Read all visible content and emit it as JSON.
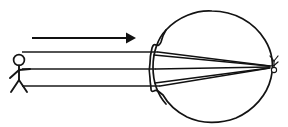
{
  "diagram": {
    "caption": "Light rays from a standing person travel to the right, refract at the cornea and lens of the eye, and converge to form a small inverted image on the retina.",
    "background_color": "#ffffff",
    "ink_color": "#141414",
    "canvas": {
      "width": 288,
      "height": 127
    }
  },
  "object": {
    "name": "stick-figure-person",
    "label": "",
    "role": "object being viewed",
    "position": {
      "x": 22,
      "y": 68
    },
    "head_radius": 5.4
  },
  "light_direction": {
    "name": "light-travel-arrow",
    "label": "",
    "description": "arrow showing direction light travels",
    "from_x": 32,
    "to_x": 135,
    "y": 38
  },
  "rays": {
    "count": 3,
    "description": "three parallel incident rays",
    "incident_y_values": [
      52,
      69,
      86
    ],
    "start_x": 22,
    "cornea_x": 152,
    "focal_point": {
      "x": 271,
      "y": 67
    }
  },
  "eye": {
    "name": "eyeball",
    "label": "",
    "center": {
      "x": 212,
      "y": 66
    },
    "radius_x": 62,
    "radius_y": 56,
    "cornea_side": "left",
    "retina_side": "right"
  },
  "retinal_image": {
    "name": "inverted-image",
    "label": "",
    "description": "tiny inverted stick figure formed on the retina",
    "position": {
      "x": 273,
      "y": 66
    },
    "orientation": "inverted"
  }
}
